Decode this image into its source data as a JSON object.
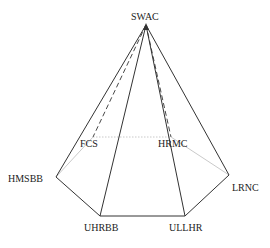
{
  "diagram": {
    "type": "pyramid",
    "apex": {
      "id": "SWAC",
      "label": "SWAC",
      "x": 146,
      "y": 25,
      "label_x": 131,
      "label_y": 12
    },
    "base_vertices": [
      {
        "id": "HMSBB",
        "label": "HMSBB",
        "x": 56,
        "y": 177,
        "label_x": 8,
        "label_y": 174,
        "visible": true
      },
      {
        "id": "UHRBB",
        "label": "UHRBB",
        "x": 100,
        "y": 216,
        "label_x": 84,
        "label_y": 223,
        "visible": true
      },
      {
        "id": "ULLHR",
        "label": "ULLHR",
        "x": 185,
        "y": 216,
        "label_x": 169,
        "label_y": 223,
        "visible": true
      },
      {
        "id": "LRNC",
        "label": "LRNC",
        "x": 229,
        "y": 175,
        "label_x": 232,
        "label_y": 183,
        "visible": true
      },
      {
        "id": "HRMC",
        "label": "HRMC",
        "x": 171,
        "y": 137,
        "label_x": 158,
        "label_y": 139,
        "visible": false
      },
      {
        "id": "FCS",
        "label": "FCS",
        "x": 93,
        "y": 137,
        "label_x": 80,
        "label_y": 139,
        "visible": false
      }
    ],
    "colors": {
      "edge": "#333333",
      "hidden_edge": "#333333",
      "hidden_base": "#bbbbbb",
      "label": "#222222"
    }
  }
}
